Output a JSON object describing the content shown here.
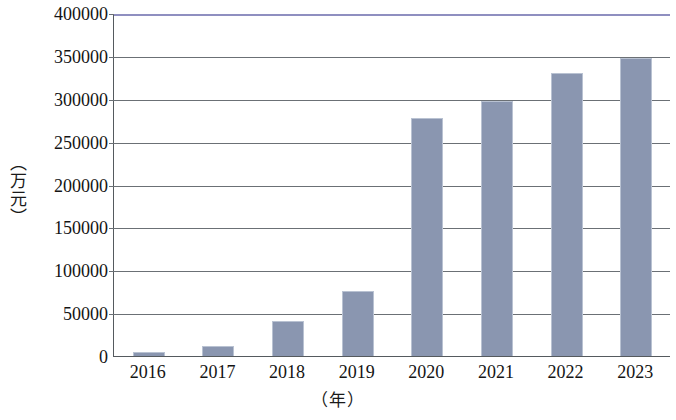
{
  "chart_data": {
    "type": "bar",
    "title": "",
    "subtitle": "",
    "xlabel": "（年）",
    "ylabel": "（万元）",
    "categories": [
      "2016",
      "2017",
      "2018",
      "2019",
      "2020",
      "2021",
      "2022",
      "2023"
    ],
    "values": [
      4500,
      12000,
      41000,
      76000,
      277000,
      297000,
      330000,
      348000
    ],
    "series": [
      {
        "name": "",
        "values": [
          4500,
          12000,
          41000,
          76000,
          277000,
          297000,
          330000,
          348000
        ]
      }
    ],
    "ylim": [
      0,
      400000
    ],
    "ytick_values": [
      0,
      50000,
      100000,
      150000,
      200000,
      250000,
      300000,
      350000,
      400000
    ],
    "ytick_labels": [
      "0",
      "50000",
      "100000",
      "150000",
      "200000",
      "250000",
      "300000",
      "350000",
      "400000"
    ],
    "grid": "horizontal",
    "legend": "none",
    "bar_color": "#8a96b0",
    "bar_border_color": "#b9c2d2",
    "axis_color": "#555a5e",
    "gridline_color": "#6b7075",
    "top_rule_color": "#8f8fc0",
    "annotations": []
  }
}
